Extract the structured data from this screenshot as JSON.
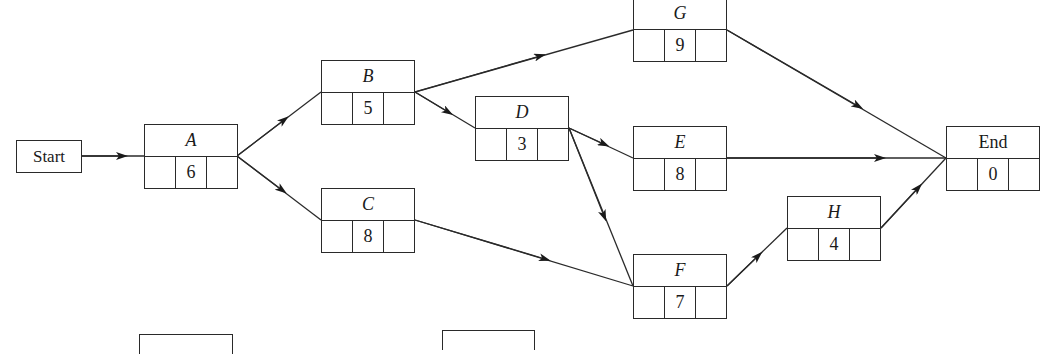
{
  "diagram": {
    "type": "activity-on-node network",
    "start": {
      "label": "Start"
    },
    "nodes": [
      {
        "id": "A",
        "label": "A",
        "duration": "6"
      },
      {
        "id": "B",
        "label": "B",
        "duration": "5"
      },
      {
        "id": "C",
        "label": "C",
        "duration": "8"
      },
      {
        "id": "D",
        "label": "D",
        "duration": "3"
      },
      {
        "id": "E",
        "label": "E",
        "duration": "8"
      },
      {
        "id": "F",
        "label": "F",
        "duration": "7"
      },
      {
        "id": "G",
        "label": "G",
        "duration": "9"
      },
      {
        "id": "H",
        "label": "H",
        "duration": "4"
      },
      {
        "id": "End",
        "label": "End",
        "duration": "0"
      }
    ],
    "edges": [
      [
        "Start",
        "A"
      ],
      [
        "A",
        "B"
      ],
      [
        "A",
        "C"
      ],
      [
        "B",
        "G"
      ],
      [
        "B",
        "D"
      ],
      [
        "D",
        "E"
      ],
      [
        "D",
        "F"
      ],
      [
        "C",
        "F"
      ],
      [
        "G",
        "End"
      ],
      [
        "E",
        "End"
      ],
      [
        "F",
        "H"
      ],
      [
        "H",
        "End"
      ]
    ]
  }
}
